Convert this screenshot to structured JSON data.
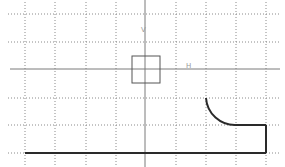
{
  "viewport": {
    "width": 285,
    "height": 167,
    "background": "#ffffff"
  },
  "colors": {
    "grid": "#8a8a8a",
    "axis": "#7a7a7a",
    "profile": "#2a2a2a",
    "square": "#555555",
    "axis_label": "#9a9a9a"
  },
  "grid": {
    "vertical_x": [
      25,
      55,
      86,
      116,
      176,
      206,
      236,
      266
    ],
    "horizontal_y": [
      14,
      42,
      98,
      125,
      153
    ],
    "extent": {
      "x1": 8,
      "x2": 280,
      "y1": 2,
      "y2": 165
    }
  },
  "axes": {
    "origin": {
      "x": 145,
      "y": 69
    },
    "h_axis": {
      "x1": 10,
      "x2": 280,
      "label": "H",
      "label_pos": {
        "x": 186,
        "y": 68
      }
    },
    "v_axis": {
      "x1": 145,
      "y1": 0,
      "y2": 167,
      "label": "V",
      "label_pos": {
        "x": 141,
        "y": 32
      }
    }
  },
  "origin_square": {
    "x": 132,
    "y": 56,
    "width": 28,
    "height": 27
  },
  "profile": {
    "bottom_line": {
      "x1": 25,
      "y1": 153,
      "x2": 266,
      "y2": 153
    },
    "right_line": {
      "x1": 266,
      "y1": 153,
      "x2": 266,
      "y2": 125
    },
    "top_line": {
      "x1": 266,
      "y1": 125,
      "x2": 236,
      "y2": 125
    },
    "arc": {
      "start": {
        "x": 236,
        "y": 125
      },
      "end": {
        "x": 206,
        "y": 98
      },
      "radius": 29
    }
  }
}
